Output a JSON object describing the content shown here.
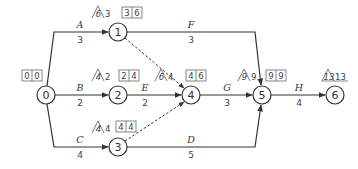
{
  "diagram": {
    "type": "activity-on-arrow network",
    "nodes": [
      {
        "id": "0",
        "label": "0"
      },
      {
        "id": "1",
        "label": "1"
      },
      {
        "id": "2",
        "label": "2"
      },
      {
        "id": "3",
        "label": "3"
      },
      {
        "id": "4",
        "label": "4"
      },
      {
        "id": "5",
        "label": "5"
      },
      {
        "id": "6",
        "label": "6"
      }
    ],
    "activities": [
      {
        "name": "A",
        "duration": "3",
        "from": "0",
        "to": "1"
      },
      {
        "name": "B",
        "duration": "2",
        "from": "0",
        "to": "2"
      },
      {
        "name": "C",
        "duration": "4",
        "from": "0",
        "to": "3"
      },
      {
        "name": "D",
        "duration": "5",
        "from": "3",
        "to": "5"
      },
      {
        "name": "E",
        "duration": "2",
        "from": "2",
        "to": "4"
      },
      {
        "name": "F",
        "duration": "3",
        "from": "1",
        "to": "5"
      },
      {
        "name": "G",
        "duration": "3",
        "from": "4",
        "to": "5"
      },
      {
        "name": "H",
        "duration": "4",
        "from": "5",
        "to": "6"
      }
    ],
    "dummies": [
      {
        "from": "1",
        "to": "4"
      },
      {
        "from": "3",
        "to": "4"
      }
    ],
    "node_annotations": {
      "n0": {
        "box": [
          "0",
          "0"
        ]
      },
      "n1": {
        "triangle": "6",
        "plain": "3",
        "box": [
          "3",
          "6"
        ]
      },
      "n2": {
        "triangle": "4",
        "plain": "2",
        "box": [
          "2",
          "4"
        ]
      },
      "n3": {
        "triangle": "4",
        "plain": "4",
        "box": [
          "4",
          "4"
        ]
      },
      "n4": {
        "triangle": "6",
        "plain": "4",
        "box": [
          "4",
          "6"
        ]
      },
      "n5": {
        "triangle": "9",
        "plain": "9",
        "box": [
          "9",
          "9"
        ]
      },
      "n6": {
        "triangle": "13",
        "plain": "13"
      }
    }
  }
}
